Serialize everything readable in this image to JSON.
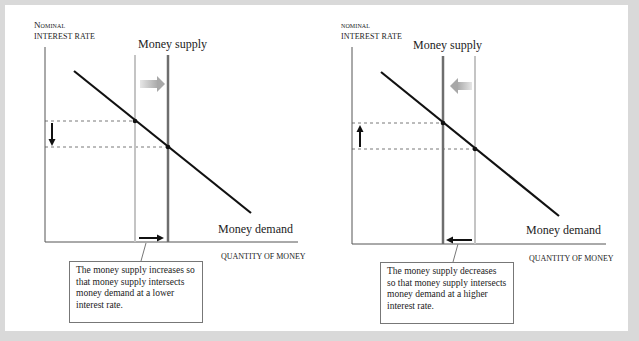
{
  "panels": [
    {
      "id": "increase",
      "y_axis_title_line1": "Nominal",
      "y_axis_title_line2": "interest rate",
      "x_axis_title": "Quantity of money",
      "supply_label": "Money supply",
      "demand_label": "Money demand",
      "shift_direction": "right",
      "rate_change_direction": "down",
      "callout": "The money supply increases so that money supply intersects money demand at a lower interest rate."
    },
    {
      "id": "decrease",
      "y_axis_title_line1": "Nominal",
      "y_axis_title_line2": "interest rate",
      "x_axis_title": "Quantity of money",
      "supply_label": "Money supply",
      "demand_label": "Money demand",
      "shift_direction": "left",
      "rate_change_direction": "up",
      "callout": "The money supply decreases so that money supply intersects money demand at a higher interest rate."
    }
  ],
  "colors": {
    "old_supply": "#c4c4c4",
    "new_supply": "#6e6e6e",
    "demand": "#111111",
    "shift_arrow": "#b5b5b5",
    "frame": "#d9d9d9"
  }
}
